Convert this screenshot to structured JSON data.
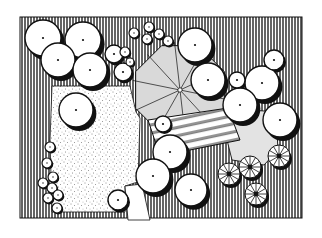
{
  "drawing": {
    "type": "landscape-site-plan",
    "style": "hand-drawn ink, black and white",
    "colors": {
      "ink": "#111111",
      "paper": "#ffffff",
      "terrace": "#d9d9d9",
      "patio": "#e3e3e3",
      "lawn_stipple": "#222222"
    },
    "frame": {
      "x": 20,
      "y": 17,
      "width": 282,
      "height": 201
    },
    "lawn": {
      "points": "52,86 130,86 136,112 140,118 138,182 125,186 125,212 52,212 50,140"
    },
    "terrace": {
      "cx": 180,
      "cy": 90,
      "r": 48
    },
    "patio": {
      "points": "228,108 276,112 278,150 264,165 232,160 224,128"
    },
    "boardwalk": {
      "points": "148,120 228,108 240,140 160,156"
    },
    "path": {
      "points": "125,186 142,184 150,220 128,220"
    },
    "large_trees": [
      {
        "cx": 43,
        "cy": 38,
        "r": 18
      },
      {
        "cx": 83,
        "cy": 40,
        "r": 18
      },
      {
        "cx": 58,
        "cy": 60,
        "r": 17
      },
      {
        "cx": 90,
        "cy": 70,
        "r": 17
      },
      {
        "cx": 195,
        "cy": 45,
        "r": 17
      },
      {
        "cx": 208,
        "cy": 80,
        "r": 17
      },
      {
        "cx": 262,
        "cy": 83,
        "r": 17
      },
      {
        "cx": 240,
        "cy": 105,
        "r": 17
      },
      {
        "cx": 280,
        "cy": 120,
        "r": 17
      },
      {
        "cx": 76,
        "cy": 110,
        "r": 17
      },
      {
        "cx": 170,
        "cy": 152,
        "r": 17
      },
      {
        "cx": 153,
        "cy": 176,
        "r": 17
      },
      {
        "cx": 191,
        "cy": 190,
        "r": 16
      }
    ],
    "small_trees": [
      {
        "cx": 114,
        "cy": 54,
        "r": 9
      },
      {
        "cx": 123,
        "cy": 72,
        "r": 9
      },
      {
        "cx": 237,
        "cy": 80,
        "r": 8
      },
      {
        "cx": 274,
        "cy": 60,
        "r": 10
      },
      {
        "cx": 163,
        "cy": 124,
        "r": 8
      },
      {
        "cx": 118,
        "cy": 200,
        "r": 10
      }
    ],
    "hedge_shrubs": [
      {
        "cx": 134,
        "cy": 33,
        "r": 5
      },
      {
        "cx": 147,
        "cy": 39,
        "r": 5
      },
      {
        "cx": 149,
        "cy": 27,
        "r": 5
      },
      {
        "cx": 159,
        "cy": 34,
        "r": 5
      },
      {
        "cx": 168,
        "cy": 41,
        "r": 5
      },
      {
        "cx": 125,
        "cy": 52,
        "r": 5
      },
      {
        "cx": 130,
        "cy": 62,
        "r": 4
      }
    ],
    "edge_shrubs": [
      {
        "cx": 50,
        "cy": 147,
        "r": 5
      },
      {
        "cx": 47,
        "cy": 163,
        "r": 5
      },
      {
        "cx": 53,
        "cy": 177,
        "r": 5
      },
      {
        "cx": 43,
        "cy": 183,
        "r": 5
      },
      {
        "cx": 52,
        "cy": 188,
        "r": 5
      },
      {
        "cx": 58,
        "cy": 195,
        "r": 5
      },
      {
        "cx": 48,
        "cy": 198,
        "r": 5
      },
      {
        "cx": 57,
        "cy": 208,
        "r": 5
      }
    ],
    "palms": [
      {
        "cx": 229,
        "cy": 174,
        "r": 11
      },
      {
        "cx": 250,
        "cy": 167,
        "r": 11
      },
      {
        "cx": 279,
        "cy": 156,
        "r": 11
      },
      {
        "cx": 256,
        "cy": 194,
        "r": 11
      }
    ]
  }
}
